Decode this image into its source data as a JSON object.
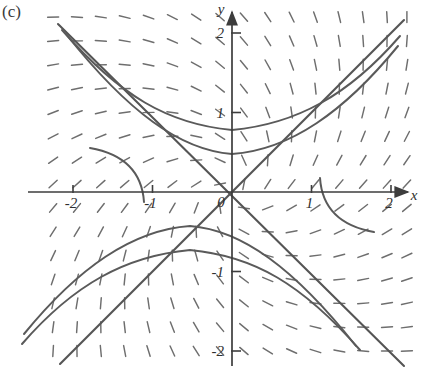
{
  "figure": {
    "panel_label": "(c)",
    "type": "direction-field-phase-portrait"
  },
  "axes": {
    "x_name": "x",
    "y_name": "y",
    "origin_label": "0",
    "x_ticks": [
      {
        "value": -2,
        "label": "-2"
      },
      {
        "value": -1,
        "label": "-1"
      },
      {
        "value": 1,
        "label": "1"
      },
      {
        "value": 2,
        "label": "2"
      }
    ],
    "y_ticks": [
      {
        "value": 2,
        "label": "2"
      },
      {
        "value": 1,
        "label": "1"
      },
      {
        "value": -1,
        "label": "-1"
      },
      {
        "value": -2,
        "label": "-2"
      }
    ],
    "x_arrow": "arrow-right",
    "y_arrow": "arrow-up"
  },
  "colors": {
    "ink": "#3d3d3d",
    "field": "#6e6e6e",
    "trajectory": "#5a5a5a",
    "background": "#ffffff"
  },
  "chart_data": {
    "type": "scatter",
    "title": "",
    "subtitle": "",
    "xlabel": "x",
    "ylabel": "y",
    "xlim": [
      -2.35,
      2.3
    ],
    "ylim": [
      -2.3,
      2.35
    ],
    "grid": false,
    "legend": "none",
    "equilibrium": {
      "x": 0,
      "y": 0,
      "kind": "saddle"
    },
    "separatrices": [
      {
        "name": "unstable",
        "line": "y = x",
        "slope": 1,
        "intercept": 0
      },
      {
        "name": "stable",
        "line": "y = -x",
        "slope": -1,
        "intercept": 0
      }
    ],
    "field": {
      "slope_formula": "dy/dx = (x + y) / (x - y)",
      "x_samples": [
        -2.25,
        -1.95,
        -1.65,
        -1.35,
        -1.05,
        -0.75,
        -0.45,
        -0.15,
        0.15,
        0.45,
        0.75,
        1.05,
        1.35,
        1.65,
        1.95,
        2.2
      ],
      "y_samples": [
        2.2,
        1.9,
        1.6,
        1.3,
        1.0,
        0.7,
        0.4,
        0.1,
        -0.2,
        -0.5,
        -0.8,
        -1.1,
        -1.4,
        -1.7,
        -2.0
      ]
    },
    "trajectories": [
      {
        "name": "upper-left-branch-outer",
        "quadrant": "II",
        "asymptote": "y = -x"
      },
      {
        "name": "upper-left-branch-inner",
        "quadrant": "II",
        "asymptote": "y = -x"
      },
      {
        "name": "upper-right-hyperbola",
        "quadrant": "I",
        "asymptote": "y = x"
      },
      {
        "name": "lower-right-branch-outer",
        "quadrant": "IV",
        "asymptote": "y = -x"
      },
      {
        "name": "lower-right-branch-inner",
        "quadrant": "IV",
        "asymptote": "y = -x"
      },
      {
        "name": "lower-left-hyperbola",
        "quadrant": "III",
        "asymptote": "y = x"
      }
    ]
  }
}
